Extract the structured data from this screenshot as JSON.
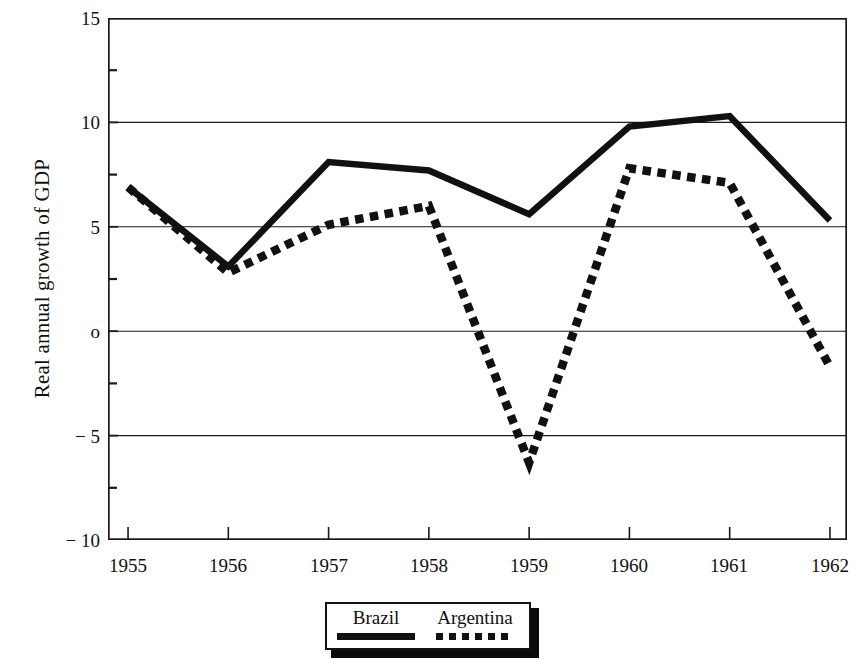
{
  "chart_data": {
    "type": "line",
    "title": "",
    "xlabel": "",
    "ylabel": "Real annual growth of GDP",
    "x": [
      1955,
      1956,
      1957,
      1958,
      1959,
      1960,
      1961,
      1962
    ],
    "categories": [
      "1955",
      "1956",
      "1957",
      "1958",
      "1959",
      "1960",
      "1961",
      "1962"
    ],
    "xlim": [
      1954.8,
      1962.17
    ],
    "ylim": [
      -10,
      15
    ],
    "yticks": [
      15,
      10,
      5,
      0,
      -5,
      -10
    ],
    "ytick_labels": [
      "15",
      "10",
      "5",
      "o",
      "− 5",
      "− 10"
    ],
    "yminor_ticks": [
      12.5,
      7.5,
      2.5,
      -2.5,
      -7.5
    ],
    "grid": "horizontal-major",
    "legend_position": "below-axes-center",
    "series": [
      {
        "name": "Brazil",
        "style": "solid",
        "color": "#111111",
        "values": [
          6.9,
          3.1,
          8.1,
          7.7,
          5.6,
          9.8,
          10.3,
          5.3
        ]
      },
      {
        "name": "Argentina",
        "style": "dotted",
        "color": "#111111",
        "values": [
          6.9,
          2.8,
          5.1,
          6.0,
          -6.3,
          7.8,
          7.1,
          -1.7
        ]
      }
    ]
  },
  "axes": {
    "ylabel": "Real annual growth of GDP",
    "ytick_labels": [
      "15",
      "10",
      "5",
      "o",
      "− 5",
      "− 10"
    ],
    "xtick_labels": [
      "1955",
      "1956",
      "1957",
      "1958",
      "1959",
      "1960",
      "1961",
      "1962"
    ]
  },
  "legend": {
    "brazil_label": "Brazil",
    "argentina_label": "Argentina"
  }
}
